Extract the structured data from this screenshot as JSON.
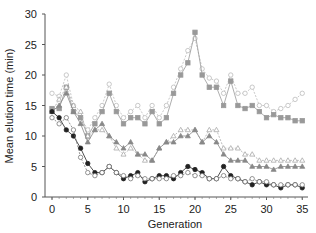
{
  "chart_data": {
    "type": "line",
    "title": "",
    "xlabel": "Generation",
    "ylabel": "Mean elution time (min)",
    "xlim": [
      -1,
      36
    ],
    "ylim": [
      0,
      30
    ],
    "xticks": [
      0,
      5,
      10,
      15,
      20,
      25,
      30,
      35
    ],
    "yticks": [
      0,
      5,
      10,
      15,
      20,
      25,
      30
    ],
    "grid": false,
    "legend": null,
    "x": [
      0,
      1,
      2,
      3,
      4,
      5,
      6,
      7,
      8,
      9,
      10,
      11,
      12,
      13,
      14,
      15,
      16,
      17,
      18,
      19,
      20,
      21,
      22,
      23,
      24,
      25,
      26,
      27,
      28,
      29,
      30,
      31,
      32,
      33,
      34,
      35
    ],
    "series": [
      {
        "name": "open circle (light dashed, top)",
        "marker": "circle-open",
        "color": "#bbbbbb",
        "values": [
          17,
          16.5,
          20,
          15,
          13,
          11,
          13,
          15,
          18.5,
          15,
          13,
          14,
          15,
          13,
          15,
          13,
          15,
          18,
          21,
          24,
          26,
          21,
          19.5,
          19,
          17,
          20,
          17,
          17,
          18,
          15,
          15,
          14,
          14.5,
          15,
          16,
          17
        ]
      },
      {
        "name": "grey square",
        "marker": "square-filled",
        "color": "#999999",
        "values": [
          14.5,
          14.5,
          18,
          14,
          13,
          10,
          12,
          14,
          17,
          14,
          12,
          13,
          13,
          12,
          14,
          12,
          13,
          17,
          20,
          22,
          27,
          20,
          18,
          18,
          15,
          19,
          15,
          14.5,
          15,
          14,
          13,
          13.5,
          13,
          13,
          12.5,
          12.5
        ]
      },
      {
        "name": "open triangle",
        "marker": "triangle-open",
        "color": "#aaaaaa",
        "values": [
          14,
          16,
          18,
          15,
          14,
          10,
          11,
          11,
          10,
          8,
          7,
          8,
          7,
          6,
          6,
          8,
          9,
          10,
          11,
          11,
          11,
          9,
          11,
          11,
          8,
          8,
          8,
          7,
          7,
          6,
          6,
          6,
          6,
          6,
          6,
          6
        ]
      },
      {
        "name": "grey triangle",
        "marker": "triangle-filled",
        "color": "#888888",
        "values": [
          14,
          15,
          17,
          14,
          12,
          9,
          11,
          12,
          10,
          9,
          8,
          9,
          7,
          7,
          6,
          8,
          9,
          9,
          10,
          10,
          11,
          9,
          10,
          9,
          7,
          6,
          6,
          6,
          5,
          5,
          5,
          4.5,
          5,
          5,
          5,
          5
        ]
      },
      {
        "name": "black circle",
        "marker": "circle-filled",
        "color": "#222222",
        "values": [
          14,
          13,
          11,
          10,
          8,
          5.5,
          4,
          4,
          5,
          4,
          3,
          3.5,
          4,
          2.5,
          3,
          3.5,
          3.5,
          3,
          4,
          5,
          4.5,
          4,
          3,
          3,
          5,
          3.5,
          3,
          2.5,
          2,
          2.5,
          2,
          2,
          1.5,
          2,
          2,
          1.5
        ]
      },
      {
        "name": "open circle (low)",
        "marker": "circle-open",
        "color": "#777777",
        "values": [
          13,
          12,
          13,
          11,
          6.5,
          4,
          3.5,
          4,
          5,
          4,
          3.5,
          3,
          3.5,
          3,
          3,
          3,
          3,
          3.5,
          3.5,
          4,
          3.5,
          3.5,
          3,
          3,
          3.5,
          3,
          3,
          2.5,
          3,
          2.5,
          2.5,
          2,
          2,
          2,
          2,
          2
        ]
      }
    ]
  }
}
